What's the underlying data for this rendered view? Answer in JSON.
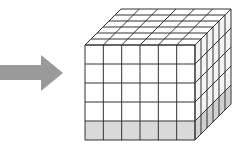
{
  "diagram": {
    "arrow": {
      "direction": "right",
      "color": "#9a9a9a"
    },
    "cube": {
      "columns": 6,
      "depth": 6,
      "rows": 5,
      "shaded_bottom_rows": 1,
      "face_color": "#ffffff",
      "shaded_color": "#d9d9d9",
      "line_color": "#333333"
    }
  }
}
